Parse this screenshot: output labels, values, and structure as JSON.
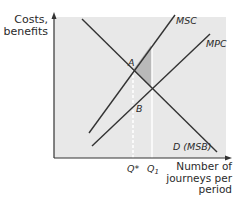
{
  "diagram": {
    "y_axis_label_line1": "Costs,",
    "y_axis_label_line2": "benefits",
    "x_axis_label_line1": "Number of",
    "x_axis_label_line2": "journeys per",
    "x_axis_label_line3": "period",
    "curves": {
      "msc": "MSC",
      "mpc": "MPC",
      "demand": "D (MSB)"
    },
    "points": {
      "a": "A",
      "b": "B"
    },
    "ticks": {
      "q_star": "Q*",
      "q1_base": "Q",
      "q1_sub": "1"
    },
    "colors": {
      "plot_background": "#e8e8e8",
      "line": "#333333",
      "shaded_area": "#b9b9b9",
      "guide_line": "#ffffff"
    }
  }
}
